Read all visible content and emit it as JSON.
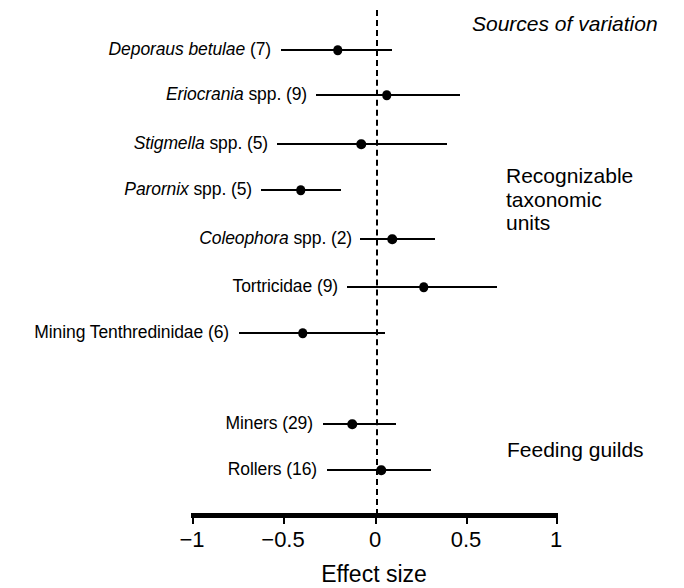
{
  "chart_data": {
    "type": "scatter",
    "title": "",
    "xlabel": "Effect size",
    "ylabel": "",
    "xlim": [
      -1,
      1
    ],
    "xticks": [
      -1,
      -0.5,
      0,
      0.5,
      1
    ],
    "xticklabels": [
      "−1",
      "−0.5",
      "0",
      "0.5",
      "1"
    ],
    "grid": false,
    "reference_line": 0,
    "reference_line_style": "dashed",
    "legend": "none",
    "groups": [
      {
        "name": "Recognizable taxonomic units",
        "label_lines": "Recognizable\ntaxonomic\nunits",
        "rows": [
          {
            "label_italic": "Deporaus betulae",
            "label_plain": " (7)",
            "n": 7,
            "effect": -0.21,
            "ci_low": -0.52,
            "ci_high": 0.09
          },
          {
            "label_italic": "Eriocrania",
            "label_plain": " spp. (9)",
            "n": 9,
            "effect": 0.06,
            "ci_low": -0.33,
            "ci_high": 0.46
          },
          {
            "label_italic": "Stigmella",
            "label_plain": " spp. (5)",
            "n": 5,
            "effect": -0.08,
            "ci_low": -0.54,
            "ci_high": 0.39
          },
          {
            "label_italic": "Parornix",
            "label_plain": " spp. (5)",
            "n": 5,
            "effect": -0.41,
            "ci_low": -0.63,
            "ci_high": -0.19
          },
          {
            "label_italic": "Coleophora",
            "label_plain": " spp. (2)",
            "n": 2,
            "effect": 0.09,
            "ci_low": -0.09,
            "ci_high": 0.32
          },
          {
            "label_italic": "",
            "label_plain": "Tortricidae (9)",
            "n": 9,
            "effect": 0.26,
            "ci_low": -0.16,
            "ci_high": 0.66
          },
          {
            "label_italic": "",
            "label_plain": "Mining Tenthredinidae (6)",
            "n": 6,
            "effect": -0.4,
            "ci_low": -0.75,
            "ci_high": 0.05
          }
        ]
      },
      {
        "name": "Feeding guilds",
        "label_lines": "Feeding guilds",
        "rows": [
          {
            "label_italic": "",
            "label_plain": "Miners (29)",
            "n": 29,
            "effect": -0.13,
            "ci_low": -0.29,
            "ci_high": 0.11
          },
          {
            "label_italic": "",
            "label_plain": "Rollers (16)",
            "n": 16,
            "effect": 0.03,
            "ci_low": -0.27,
            "ci_high": 0.3
          }
        ]
      }
    ],
    "header_note": "Sources of variation"
  },
  "annotations": {
    "header": "Sources of variation",
    "group_rtu": "Recognizable\ntaxonomic\nunits",
    "group_guilds": "Feeding guilds"
  },
  "axis": {
    "title": "Effect size",
    "ticklabels": [
      "−1",
      "−0.5",
      "0",
      "0.5",
      "1"
    ]
  },
  "colors": {
    "ink": "#000000",
    "background": "#ffffff"
  }
}
